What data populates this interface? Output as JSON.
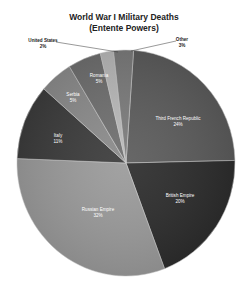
{
  "chart_data": {
    "type": "pie",
    "title": "World War I Military Deaths",
    "subtitle": "(Entente Powers)",
    "slices": [
      {
        "label": "Third French Republic",
        "value": 24,
        "display": "24%",
        "color": "#5a5a5a"
      },
      {
        "label": "British Empire",
        "value": 20,
        "display": "20%",
        "color": "#2b2b2b"
      },
      {
        "label": "Russian Empire",
        "value": 32,
        "display": "32%",
        "color": "#9a9a9a"
      },
      {
        "label": "Italy",
        "value": 11,
        "display": "11%",
        "color": "#3a3a3a"
      },
      {
        "label": "Serbia",
        "value": 5,
        "display": "5%",
        "color": "#8a8a8a"
      },
      {
        "label": "Romania",
        "value": 5,
        "display": "5%",
        "color": "#6e6e6e"
      },
      {
        "label": "United States",
        "value": 2,
        "display": "2%",
        "color": "#b8b8b8"
      },
      {
        "label": "Other",
        "value": 3,
        "display": "3%",
        "color": "#7a7a7a"
      }
    ],
    "legend": "none",
    "data_labels": "category name and percentage"
  },
  "labels": {
    "france": {
      "name": "Third French Republic",
      "pct": "24%"
    },
    "british": {
      "name": "British Empire",
      "pct": "20%"
    },
    "russia": {
      "name": "Russian Empire",
      "pct": "32%"
    },
    "italy": {
      "name": "Italy",
      "pct": "11%"
    },
    "serbia": {
      "name": "Serbia",
      "pct": "5%"
    },
    "romania": {
      "name": "Romania",
      "pct": "5%"
    },
    "us": {
      "name": "United States",
      "pct": "2%"
    },
    "other": {
      "name": "Other",
      "pct": "3%"
    }
  }
}
